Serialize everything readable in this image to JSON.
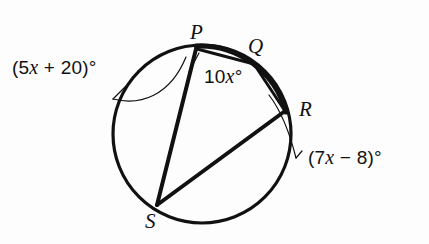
{
  "figure": {
    "background_color": "#fdfdfd",
    "stroke_color": "#111111",
    "points": {
      "P": {
        "label": "P",
        "x": 196,
        "y": 50
      },
      "Q": {
        "label": "Q",
        "x": 252,
        "y": 62
      },
      "R": {
        "label": "R",
        "x": 284,
        "y": 110
      },
      "S": {
        "label": "S",
        "x": 157,
        "y": 205
      }
    },
    "circle": {
      "cx": 202,
      "cy": 134,
      "r": 89
    },
    "arc_labels": {
      "arc_SP": {
        "text": "(5x + 20)°",
        "prefix": "(5",
        "variable": "x",
        "suffix": " + 20)°"
      },
      "arc_PQ": {
        "text": "10x°",
        "prefix": "10",
        "variable": "x",
        "suffix": "°"
      },
      "arc_QR": {
        "text": "(7x − 8)°",
        "prefix": "(7",
        "variable": "x",
        "suffix": " − 8)°"
      }
    },
    "chords": [
      {
        "name": "chord-PS",
        "from": "P",
        "to": "S"
      },
      {
        "name": "chord-SR",
        "from": "S",
        "to": "R"
      },
      {
        "name": "chord-PQ",
        "from": "P",
        "to": "Q"
      },
      {
        "name": "chord-QR",
        "from": "Q",
        "to": "R"
      }
    ]
  }
}
